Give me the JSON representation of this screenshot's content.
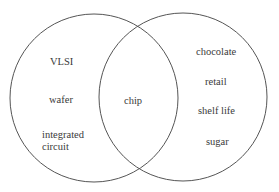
{
  "diagram": {
    "type": "venn",
    "sets": [
      {
        "name": "left",
        "only": [
          "VLSI",
          "wafer",
          "integrated circuit"
        ]
      },
      {
        "name": "right",
        "only": [
          "chocolate",
          "retail",
          "shelf life",
          "sugar"
        ]
      }
    ],
    "intersection": [
      "chip"
    ],
    "colors": {
      "stroke": "#555555",
      "text": "#3a3a3a",
      "background": "#ffffff"
    }
  },
  "labels": {
    "vlsi": "VLSI",
    "wafer": "wafer",
    "integrated_1": "integrated",
    "integrated_2": "circuit",
    "chip": "chip",
    "chocolate": "chocolate",
    "retail": "retail",
    "shelf_life": "shelf life",
    "sugar": "sugar"
  }
}
